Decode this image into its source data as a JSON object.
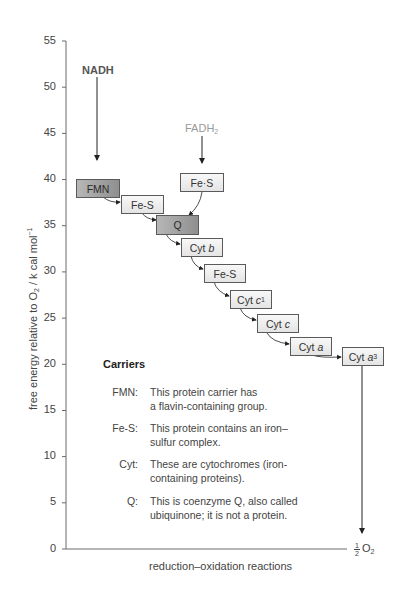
{
  "diagram": {
    "type": "energy-level-diagram",
    "y_axis": {
      "label_prefix": "free energy relative to O",
      "label_sub": "2",
      "label_suffix": " / k cal mol",
      "label_sup": "−1",
      "ticks": [
        "55",
        "50",
        "45",
        "40",
        "35",
        "30",
        "25",
        "20",
        "15",
        "10",
        "5",
        "0"
      ],
      "range": [
        0,
        55
      ]
    },
    "x_axis": {
      "label": "reduction–oxidation reactions",
      "end_label_frac_num": "1",
      "end_label_frac_den": "2",
      "end_label_main": "O",
      "end_label_sub": "2"
    },
    "inputs": {
      "nadh": "NADH",
      "fadh2_main": "FADH",
      "fadh2_sub": "2"
    },
    "carriers": [
      {
        "id": "fmn",
        "label": "FMN",
        "italic": "",
        "sub": "",
        "energy": 39,
        "shade": "dark"
      },
      {
        "id": "fes1",
        "label": "Fe-S",
        "italic": "",
        "sub": "",
        "energy": 37,
        "shade": "light"
      },
      {
        "id": "q",
        "label": "Q",
        "italic": "",
        "sub": "",
        "energy": 34.5,
        "shade": "dark"
      },
      {
        "id": "fes-fadh",
        "label": "Fe·S",
        "italic": "",
        "sub": "",
        "energy": 39.5,
        "shade": "light"
      },
      {
        "id": "cyt-b",
        "label": "Cyt ",
        "italic": "b",
        "sub": "",
        "energy": 32.5,
        "shade": "light"
      },
      {
        "id": "fes2",
        "label": "Fe-S",
        "italic": "",
        "sub": "",
        "energy": 29.5,
        "shade": "light"
      },
      {
        "id": "cyt-c1",
        "label": "Cyt ",
        "italic": "c",
        "sub": "1",
        "energy": 26.5,
        "shade": "light"
      },
      {
        "id": "cyt-c",
        "label": "Cyt ",
        "italic": "c",
        "sub": "",
        "energy": 24,
        "shade": "light"
      },
      {
        "id": "cyt-a",
        "label": "Cyt ",
        "italic": "a",
        "sub": "",
        "energy": 21.5,
        "shade": "light"
      },
      {
        "id": "cyt-a3",
        "label": "Cyt ",
        "italic": "a",
        "sub": "3",
        "energy": 20.5,
        "shade": "light"
      }
    ],
    "legend": {
      "title": "Carriers",
      "items": [
        {
          "key": "FMN:",
          "line1": "This protein carrier has",
          "line2": "a flavin-containing group."
        },
        {
          "key": "Fe-S:",
          "line1": "This protein contains an iron–",
          "line2": "sulfur complex."
        },
        {
          "key": "Cyt:",
          "line1": "These are cytochromes (iron-",
          "line2": "containing proteins)."
        },
        {
          "key": "Q:",
          "line1": "This is coenzyme Q, also called",
          "line2": "ubiquinone; it is not a protein."
        }
      ]
    },
    "colors": {
      "axis": "#6a6a6a",
      "box_border": "#5a5a5a",
      "box_light": "#eeeeee",
      "box_dark": "#a4a4a4",
      "fadh_text": "#9a9a9a",
      "nadh_text": "#555555"
    }
  }
}
